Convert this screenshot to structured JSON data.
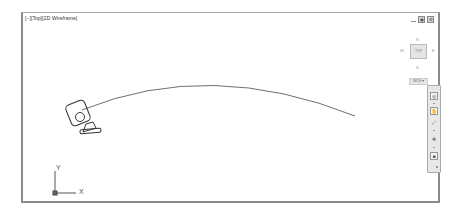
{
  "viewport": {
    "label": "[−][Top][2D Wireframe]",
    "controls": [
      {
        "name": "minimize",
        "glyph": ""
      },
      {
        "name": "restore",
        "glyph": "▣"
      },
      {
        "name": "close",
        "glyph": "☒"
      }
    ]
  },
  "viewcube": {
    "north": "N",
    "south": "S",
    "east": "E",
    "west": "W",
    "face": "TOP",
    "wcs_menu": "WCS ▾"
  },
  "navbar": {
    "buttons": [
      {
        "name": "steering-wheel",
        "glyph": "◎"
      },
      {
        "name": "pan",
        "glyph": "✋"
      },
      {
        "name": "zoom-extents",
        "glyph": "⤢"
      },
      {
        "name": "orbit",
        "glyph": "✥"
      },
      {
        "name": "showmotion",
        "glyph": "■"
      }
    ]
  },
  "ucs": {
    "x_label": "X",
    "y_label": "Y"
  },
  "drawing": {
    "objects": [
      "camera-glyph",
      "arc-polyline"
    ]
  }
}
